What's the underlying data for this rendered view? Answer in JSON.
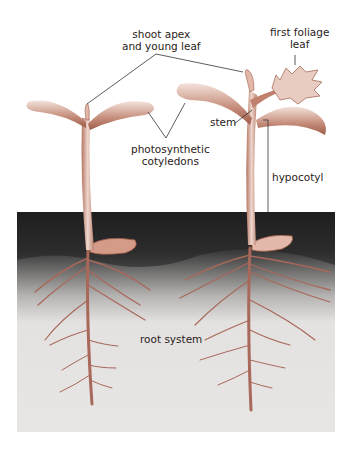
{
  "diagram": {
    "labels": {
      "shoot_apex": [
        "shoot apex",
        "and young leaf"
      ],
      "first_foliage_leaf": [
        "first foliage",
        "leaf"
      ],
      "stem": "stem",
      "cotyledons": [
        "photosynthetic",
        "cotyledons"
      ],
      "hypocotyl": "hypocotyl",
      "root_system": "root system"
    },
    "colors": {
      "plant": "#c9907e",
      "plant_dark": "#9a5a48",
      "plant_light": "#f0dcd4",
      "soil_dark": "#1e1e1e",
      "soil_light": "#e6e4e2",
      "leader_line": "#333333"
    }
  }
}
